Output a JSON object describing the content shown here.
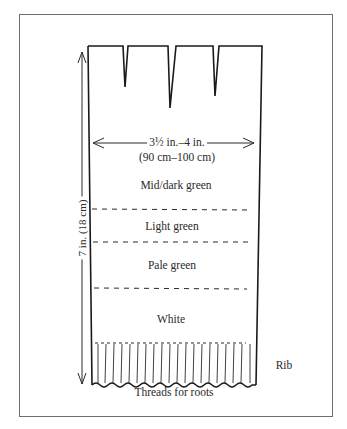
{
  "figure": {
    "width_label_line1": "3½ in.–4 in.",
    "width_label_line2": "(90 cm–100 cm)",
    "height_label": "7 in. (18 cm)",
    "bands": [
      {
        "label": "Mid/dark green"
      },
      {
        "label": "Light green"
      },
      {
        "label": "Pale green"
      },
      {
        "label": "White"
      }
    ],
    "rib_label": "Rib",
    "bottom_label": "Threads for roots",
    "colors": {
      "ink": "#2a2a2a",
      "frame": "#6e6e6e",
      "background": "#ffffff"
    }
  }
}
